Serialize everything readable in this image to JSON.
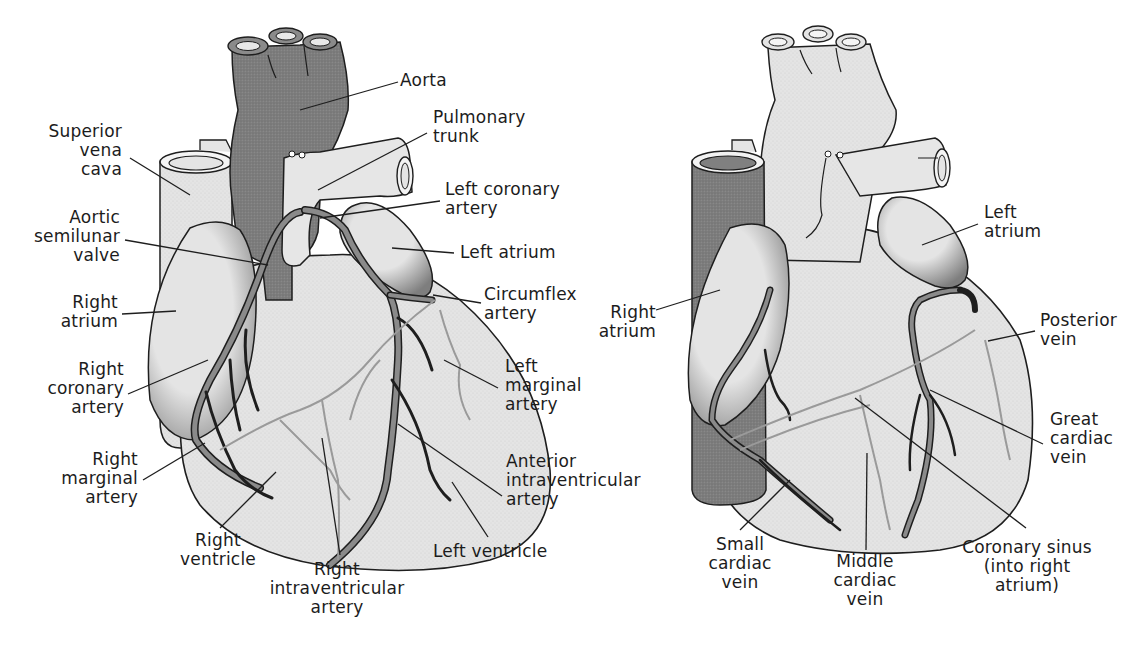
{
  "colors": {
    "background": "#ffffff",
    "tissue_fill": "#e4e4e4",
    "aorta_fill": "#7d7d7d",
    "vena_cava_dark_fill": "#6e6e6e",
    "vessel_fill": "#8a8a8a",
    "outline": "#1e1e1e",
    "leader_line": "#1e1e1e",
    "faint_vessel": "#9a9a9a"
  },
  "anterior_view": {
    "labels": {
      "aorta": "Aorta",
      "pulmonary_trunk": "Pulmonary\ntrunk",
      "superior_vena_cava": "Superior\nvena\ncava",
      "left_coronary_artery": "Left coronary\nartery",
      "aortic_semilunar_valve": "Aortic\nsemilunar\nvalve",
      "left_atrium": "Left atrium",
      "right_atrium": "Right\natrium",
      "circumflex_artery": "Circumflex\nartery",
      "right_coronary_artery": "Right\ncoronary\nartery",
      "left_marginal_artery": "Left\nmarginal\nartery",
      "right_marginal_artery": "Right\nmarginal\nartery",
      "anterior_intraventricular_artery": "Anterior\nintraventricular\nartery",
      "right_ventricle": "Right\nventricle",
      "right_intraventricular_artery": "Right\nintraventricular\nartery",
      "left_ventricle": "Left ventricle"
    }
  },
  "posterior_view": {
    "labels": {
      "left_atrium": "Left\natrium",
      "right_atrium": "Right\natrium",
      "posterior_vein": "Posterior\nvein",
      "great_cardiac_vein": "Great\ncardiac\nvein",
      "small_cardiac_vein": "Small\ncardiac\nvein",
      "middle_cardiac_vein": "Middle\ncardiac\nvein",
      "coronary_sinus": "Coronary sinus\n(into right\natrium)"
    }
  }
}
